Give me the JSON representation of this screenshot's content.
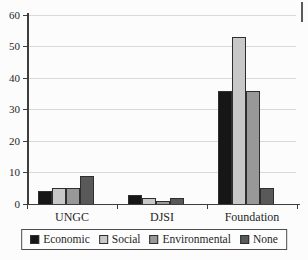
{
  "chart_data": {
    "type": "bar",
    "categories": [
      "UNGC",
      "DJSI",
      "Foundation"
    ],
    "series": [
      {
        "name": "Economic",
        "color": "#161616",
        "values": [
          4,
          3,
          36
        ]
      },
      {
        "name": "Social",
        "color": "#c8c8c8",
        "values": [
          5,
          2,
          53
        ]
      },
      {
        "name": "Environmental",
        "color": "#989898",
        "values": [
          5,
          1,
          36
        ]
      },
      {
        "name": "None",
        "color": "#595959",
        "values": [
          9,
          2,
          5
        ]
      }
    ],
    "title": "",
    "xlabel": "",
    "ylabel": "",
    "ylim": [
      0,
      60
    ],
    "yticks": [
      0,
      10,
      20,
      30,
      40,
      50,
      60
    ],
    "grid": true,
    "legend_position": "bottom",
    "colors": {
      "gridline": "#d9d9d9",
      "axis": "#3d3d3d",
      "text": "#262626",
      "background": "#fcfcfc"
    }
  }
}
